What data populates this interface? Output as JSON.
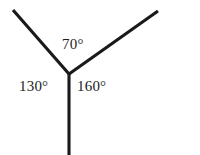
{
  "figure": {
    "type": "angles-at-a-point-diagram",
    "background_color": "#ffffff",
    "line_color": "#1a1a1a",
    "line_width_px": 3,
    "text_color": "#1d1d1d",
    "vertex": {
      "x": 69,
      "y": 74
    },
    "rays": [
      {
        "name": "upper-left-ray",
        "from": {
          "x": 69,
          "y": 74
        },
        "to": {
          "x": 13,
          "y": 10
        },
        "direction": "up-left"
      },
      {
        "name": "upper-right-ray",
        "from": {
          "x": 69,
          "y": 74
        },
        "to": {
          "x": 158,
          "y": 11
        },
        "direction": "up-right"
      },
      {
        "name": "lower-vertical-ray",
        "from": {
          "x": 69,
          "y": 74
        },
        "to": {
          "x": 69,
          "y": 155
        },
        "direction": "down"
      }
    ],
    "angle_labels": [
      {
        "id": "top",
        "text": "70°",
        "value": 70,
        "unit": "degrees",
        "between_rays": [
          "upper-left-ray",
          "upper-right-ray"
        ],
        "position": {
          "x": 62,
          "y": 37
        }
      },
      {
        "id": "left",
        "text": "130°",
        "value": 130,
        "unit": "degrees",
        "between_rays": [
          "upper-left-ray",
          "lower-vertical-ray"
        ],
        "position": {
          "x": 19,
          "y": 79
        }
      },
      {
        "id": "right",
        "text": "160°",
        "value": 160,
        "unit": "degrees",
        "between_rays": [
          "lower-vertical-ray",
          "upper-right-ray"
        ],
        "position": {
          "x": 77,
          "y": 79
        }
      }
    ]
  }
}
